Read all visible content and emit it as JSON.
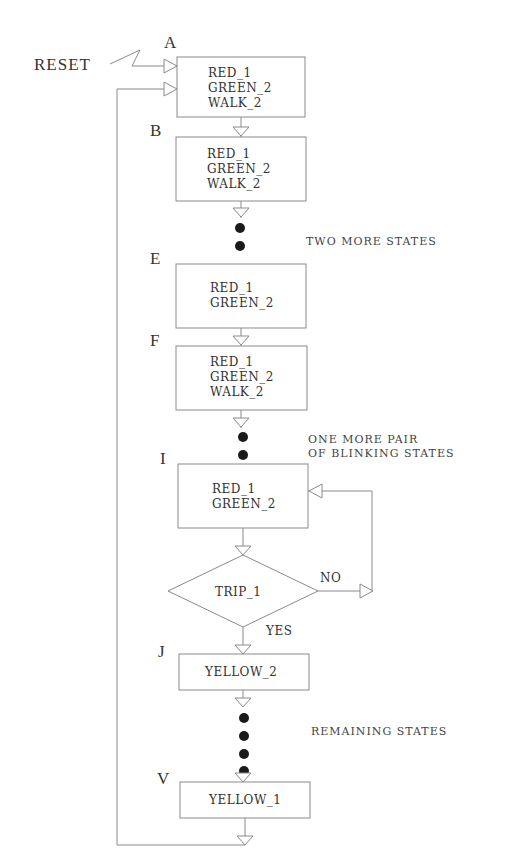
{
  "diagram": {
    "type": "state-flowchart",
    "reset_label": "RESET",
    "states": [
      {
        "id": "A",
        "lines": [
          "RED_1",
          "GREEN_2",
          "WALK_2"
        ]
      },
      {
        "id": "B",
        "lines": [
          "RED_1",
          "GREEN_2",
          "WALK_2"
        ]
      },
      {
        "id": "E",
        "lines": [
          "RED_1",
          "GREEN_2"
        ]
      },
      {
        "id": "F",
        "lines": [
          "RED_1",
          "GREEN_2",
          "WALK_2"
        ]
      },
      {
        "id": "I",
        "lines": [
          "RED_1",
          "GREEN_2"
        ]
      },
      {
        "id": "J",
        "lines": [
          "YELLOW_2"
        ]
      },
      {
        "id": "V",
        "lines": [
          "YELLOW_1"
        ]
      }
    ],
    "decision": {
      "label": "TRIP_1",
      "no_label": "NO",
      "yes_label": "YES"
    },
    "notes": {
      "after_b": "TWO MORE STATES",
      "after_f_line1": "ONE MORE PAIR",
      "after_f_line2": "OF BLINKING STATES",
      "after_j": "REMAINING STATES"
    },
    "colors": {
      "line": "#8a8a8a",
      "text": "#333333",
      "dot": "#1a1a1a"
    }
  }
}
